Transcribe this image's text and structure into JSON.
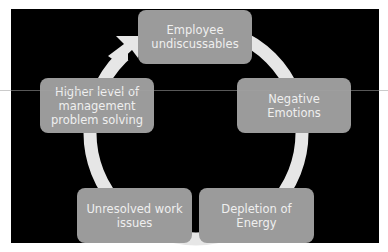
{
  "diagram": {
    "type": "cycle",
    "background_color": "#000000",
    "box_color": "#9b9b9b",
    "text_color": "#efefef",
    "arc_color": "#e6e6e6",
    "nodes": [
      {
        "id": "top",
        "label": "Employee undiscussables",
        "lines": [
          "Employee",
          "undiscussables"
        ]
      },
      {
        "id": "right",
        "label": "Negative Emotions",
        "lines": [
          "Negative Emotions"
        ]
      },
      {
        "id": "bottom-right",
        "label": "Depletion of Energy",
        "lines": [
          "Depletion of",
          "Energy"
        ]
      },
      {
        "id": "bottom-left",
        "label": "Unresolved work issues",
        "lines": [
          "Unresolved work",
          "issues"
        ]
      },
      {
        "id": "left",
        "label": "Higher level of management problem solving",
        "lines": [
          "Higher level of",
          "management",
          "problem solving"
        ]
      }
    ],
    "edges": [
      {
        "from": "top",
        "to": "right"
      },
      {
        "from": "right",
        "to": "bottom-right"
      },
      {
        "from": "bottom-right",
        "to": "bottom-left"
      },
      {
        "from": "bottom-left",
        "to": "left"
      },
      {
        "from": "left",
        "to": "top",
        "arrowhead": true
      }
    ]
  }
}
